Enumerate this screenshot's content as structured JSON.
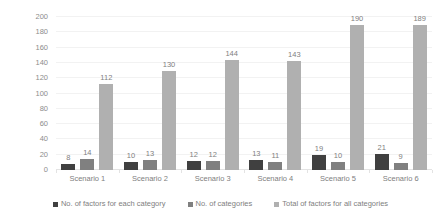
{
  "chart_data": {
    "type": "bar",
    "title": "",
    "xlabel": "",
    "ylabel": "Number of factors / categories",
    "ylim": [
      0,
      200
    ],
    "ytick_step": 20,
    "yticks": [
      200,
      180,
      160,
      140,
      120,
      100,
      80,
      60,
      40,
      20,
      0
    ],
    "grid": true,
    "legend_position": "bottom",
    "categories": [
      "Scenario 1",
      "Scenario 2",
      "Scenario 3",
      "Scenario 4",
      "Scenario 5",
      "Scenario 6"
    ],
    "series": [
      {
        "name": "No. of factors for each category",
        "color": "#404040",
        "values": [
          8,
          10,
          12,
          13,
          19,
          21
        ]
      },
      {
        "name": "No. of categories",
        "color": "#808080",
        "values": [
          14,
          13,
          12,
          11,
          10,
          9
        ]
      },
      {
        "name": "Total of factors for all categories",
        "color": "#b0b0b0",
        "values": [
          112,
          130,
          144,
          143,
          190,
          189
        ]
      }
    ],
    "data_labels": [
      [
        "8",
        "14",
        "112"
      ],
      [
        "10",
        "13",
        "130"
      ],
      [
        "12",
        "12",
        "144"
      ],
      [
        "13",
        "11",
        "143"
      ],
      [
        "19",
        "10",
        "190"
      ],
      [
        "21",
        "9",
        "189"
      ]
    ]
  }
}
